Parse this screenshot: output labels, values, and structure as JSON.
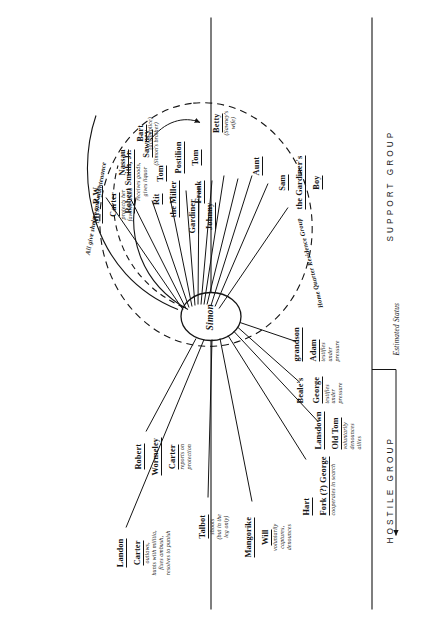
{
  "diagram": {
    "center_node": {
      "label": "Simon"
    },
    "axis_labels": {
      "hostile": "HOSTILE GROUP",
      "support": "SUPPORT GROUP",
      "estimated_status": "Estimated Status"
    },
    "group_ring": {
      "inner_label": "Home Quarter Residence Group",
      "outer_label": "All give shelter and maintenance"
    },
    "support_nodes": [
      {
        "name_lines": [
          "Mrs. R.W.",
          "Carter"
        ],
        "desc": "protects her\nfavorite maid"
      },
      {
        "name_lines": [
          "Robert Smith, Jr."
        ],
        "desc": "receives goods,\ngives liquor"
      },
      {
        "name_lines": [
          "Rit",
          "the Miller"
        ],
        "desc": ""
      },
      {
        "name_lines": [
          "Gardiner",
          "Johnny"
        ],
        "desc": ""
      },
      {
        "name_lines": [
          "Frank"
        ],
        "desc": ""
      },
      {
        "name_lines": [
          "Tom"
        ],
        "desc": ""
      },
      {
        "name_lines": [
          "Nassau"
        ],
        "desc": ""
      },
      {
        "name_lines": [
          "Sawney"
        ],
        "desc": "(Simon's brother)"
      },
      {
        "name_lines": [
          "Postilion",
          "Tom"
        ],
        "desc": ""
      },
      {
        "name_lines": [
          "Bart"
        ],
        "desc": "(accomplice)"
      },
      {
        "name_lines": [
          "Betty"
        ],
        "desc": "(Sawney's\nwife)"
      },
      {
        "name_lines": [
          "Aunt"
        ],
        "desc": ""
      },
      {
        "name_lines": [
          "Sam",
          "the Gardiner's",
          "Boy"
        ],
        "desc": ""
      }
    ],
    "hostile_nodes": [
      {
        "name_lines": [
          "Robert",
          "Wormeley",
          "Carter"
        ],
        "desc": "reports on\nprotection"
      },
      {
        "name_lines": [
          "Landon",
          "Carter"
        ],
        "desc": "outlaws,\nhunts with militia,\nfixes ambush,\nresolves to punish"
      },
      {
        "name_lines": [
          "Talbot"
        ],
        "desc": "shoots\n(but in the\nleg only)"
      },
      {
        "name_lines": [
          "Mangorike",
          "Will"
        ],
        "desc": "voluntarily\ncaptures,\ndenounces"
      },
      {
        "name_lines": [
          "Hart",
          "Fork (?) George"
        ],
        "desc": "cooperates in search"
      },
      {
        "name_lines": [
          "Lansdown",
          "Old Tom"
        ],
        "desc": "voluntarily\ndenounces\nallies"
      },
      {
        "name_lines": [
          "Beale's",
          "George"
        ],
        "desc": "testifies\nunder\npressure"
      },
      {
        "name_lines": [
          "grandson",
          "Adam"
        ],
        "desc": "testifies\nunder\npressure"
      }
    ],
    "colors": {
      "ink": "#141414",
      "paper": "#ffffff"
    }
  }
}
